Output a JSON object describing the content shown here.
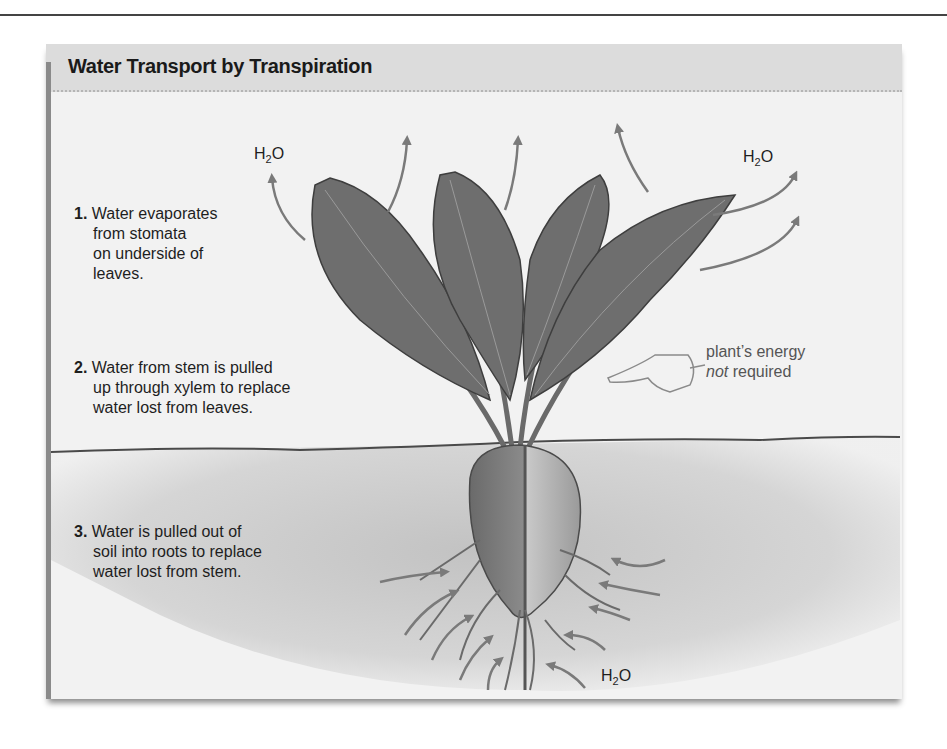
{
  "figure": {
    "title": "Water Transport by Transpiration"
  },
  "steps": [
    {
      "number": "1.",
      "lines": [
        "Water evaporates",
        "from stomata",
        "on underside of",
        "leaves."
      ]
    },
    {
      "number": "2.",
      "lines": [
        "Water from stem is pulled",
        "up through xylem to replace",
        "water lost from leaves."
      ]
    },
    {
      "number": "3.",
      "lines": [
        "Water is pulled out of",
        "soil into roots to replace",
        "water lost from stem."
      ]
    }
  ],
  "annotations": {
    "energy_note_line1": "plant’s energy",
    "energy_note_line2_italic": "not",
    "energy_note_line2_rest": " required",
    "h2o_main": "H",
    "h2o_sub": "2",
    "h2o_end": "O"
  },
  "icons": {
    "pointing_hand": "pointing-hand-icon",
    "arrows": "water-flow-arrow-icon"
  },
  "colors": {
    "panel_bg": "#f2f2f2",
    "title_bar_bg": "#dcdcdc",
    "leaf": "#6e6e6e",
    "soil": "#c9c9c9",
    "arrow": "#7a7a7a"
  }
}
